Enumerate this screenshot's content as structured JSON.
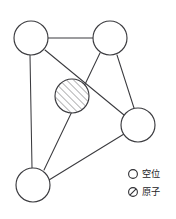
{
  "figure": {
    "kind": "crystal-lattice-defect-diagram",
    "background_color": "#ffffff",
    "line_color": "#3b3b3f",
    "width": 176,
    "height": 219
  },
  "nodes": [
    {
      "id": "top-left",
      "role": "vacancy",
      "label": "空位",
      "cx": 31,
      "cy": 38,
      "r": 17
    },
    {
      "id": "top-right",
      "role": "vacancy",
      "label": "空位",
      "cx": 110,
      "cy": 38,
      "r": 17
    },
    {
      "id": "center",
      "role": "atom",
      "label": "原子",
      "cx": 72,
      "cy": 96,
      "r": 17
    },
    {
      "id": "right",
      "role": "vacancy",
      "label": "空位",
      "cx": 138,
      "cy": 125,
      "r": 17
    },
    {
      "id": "bottom",
      "role": "vacancy",
      "label": "空位",
      "cx": 33,
      "cy": 185,
      "r": 17
    }
  ],
  "edges": [
    {
      "from": "top-left",
      "to": "top-right",
      "x1": 48,
      "y1": 38,
      "x2": 93,
      "y2": 38
    },
    {
      "from": "top-left",
      "to": "bottom",
      "x1": 30,
      "y1": 55,
      "x2": 32,
      "y2": 168
    },
    {
      "from": "top-left",
      "to": "right",
      "x1": 45,
      "y1": 50,
      "x2": 124,
      "y2": 115
    },
    {
      "from": "top-right",
      "to": "right",
      "x1": 117,
      "y1": 55,
      "x2": 134,
      "y2": 108
    },
    {
      "from": "top-right",
      "to": "bottom",
      "x1": 100,
      "y1": 53,
      "x2": 44,
      "y2": 170
    },
    {
      "from": "bottom",
      "to": "right",
      "x1": 49,
      "y1": 180,
      "x2": 124,
      "y2": 134
    }
  ],
  "legend": {
    "items": [
      {
        "glyph": "open-circle-icon",
        "symbol": "○",
        "label": "空位",
        "meaning": "vacancy",
        "x": 133,
        "y": 174
      },
      {
        "glyph": "slashed-circle-icon",
        "symbol": "⊘",
        "label": "原子",
        "meaning": "atom",
        "x": 133,
        "y": 192
      }
    ],
    "text_x": 143
  }
}
